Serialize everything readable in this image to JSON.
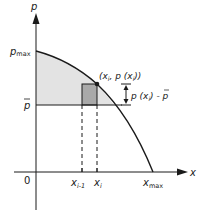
{
  "diagram": {
    "axes": {
      "y_label": "p",
      "x_label": "x",
      "origin_label": "0"
    },
    "y_ticks": {
      "p_max": {
        "base": "p",
        "sub": "max"
      },
      "p_bar": {
        "base": "p"
      }
    },
    "x_ticks": {
      "x_i_minus_1": {
        "base": "x",
        "sub": "i-1"
      },
      "x_i": {
        "base": "x",
        "sub": "i"
      },
      "x_max": {
        "base": "x",
        "sub": "max"
      }
    },
    "point_label": {
      "open": "(x",
      "sub1": "i",
      "mid": ", p (x",
      "sub2": "i",
      "close": "))"
    },
    "difference_label": {
      "pre": "p (x",
      "sub": "i",
      "post": ") - p"
    },
    "colors": {
      "shaded_region": "#e3e3e3",
      "rectangle": "#a9a9a9",
      "line": "#1a1a1a"
    }
  }
}
